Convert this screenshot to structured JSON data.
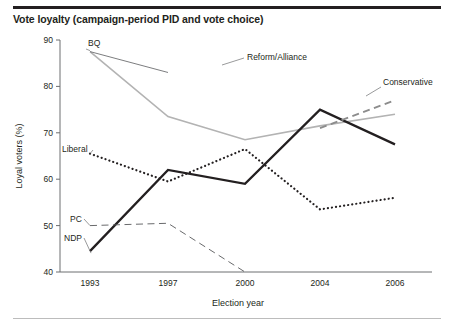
{
  "figure": {
    "title": "Vote loyalty (campaign-period PID and vote choice)",
    "has_top_rule": true,
    "has_bottom_rule": true
  },
  "chart_data": {
    "type": "line",
    "title": "Vote loyalty (campaign-period PID and vote choice)",
    "xlabel": "Election year",
    "ylabel": "Loyal voters (%)",
    "x": [
      1993,
      1997,
      2000,
      2004,
      2006
    ],
    "xtick_labels": [
      "1993",
      "1997",
      "2000",
      "2004",
      "2006"
    ],
    "ytick_labels": [
      "40",
      "50",
      "60",
      "70",
      "80",
      "90"
    ],
    "yticks": [
      40,
      50,
      60,
      70,
      80,
      90
    ],
    "ylim": [
      40,
      90
    ],
    "grid": false,
    "legend_position": "inline-labels",
    "series": [
      {
        "name": "BQ",
        "label": "BQ",
        "style": "solid",
        "color": "#b3b3b3",
        "width": 1.6,
        "x": [
          1993,
          1997,
          2000,
          2004,
          2006
        ],
        "values": [
          87.5,
          73.5,
          68.5,
          71.5,
          74.0
        ]
      },
      {
        "name": "Reform/Alliance",
        "label": "Reform/Alliance",
        "style": "solid",
        "color": "#6d6e70",
        "width": 0.9,
        "x": [
          1993,
          1997
        ],
        "values": [
          87.5,
          83.0
        ]
      },
      {
        "name": "Liberal",
        "label": "Liberal",
        "style": "dotted",
        "color": "#231f20",
        "width": 2.2,
        "x": [
          1993,
          1997,
          2000,
          2004,
          2006
        ],
        "values": [
          65.5,
          59.5,
          66.5,
          53.5,
          56.0
        ]
      },
      {
        "name": "NDP",
        "label": "NDP",
        "style": "solid",
        "color": "#231f20",
        "width": 2.3,
        "x": [
          1993,
          1997,
          2000,
          2004,
          2006
        ],
        "values": [
          44.5,
          62.0,
          59.0,
          75.0,
          67.5
        ]
      },
      {
        "name": "PC",
        "label": "PC",
        "style": "dashed",
        "color": "#58595b",
        "width": 0.9,
        "x": [
          1993,
          1997,
          2000
        ],
        "values": [
          50.0,
          50.5,
          40.0
        ]
      },
      {
        "name": "Conservative",
        "label": "Conservative",
        "style": "dashed",
        "color": "#8c8c8c",
        "width": 1.9,
        "x": [
          2004,
          2006
        ],
        "values": [
          71.0,
          77.0
        ]
      }
    ],
    "annotations": [
      {
        "text": "BQ",
        "for": "BQ",
        "leader": true
      },
      {
        "text": "Reform/Alliance",
        "for": "Reform/Alliance",
        "leader": true
      },
      {
        "text": "Conservative",
        "for": "Conservative",
        "leader": true
      },
      {
        "text": "Liberal",
        "for": "Liberal",
        "leader": true
      },
      {
        "text": "PC",
        "for": "PC",
        "leader": true
      },
      {
        "text": "NDP",
        "for": "NDP",
        "leader": true
      }
    ]
  }
}
